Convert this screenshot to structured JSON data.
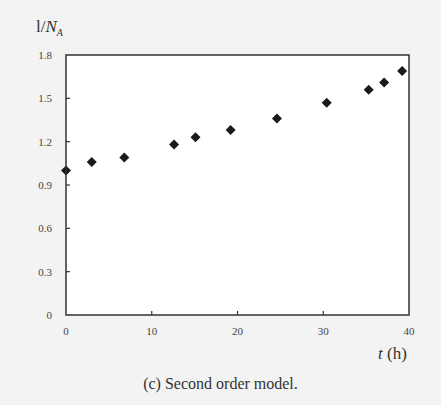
{
  "chart_data": {
    "type": "scatter",
    "title": "",
    "xlabel": "t (h)",
    "xlabel_var": "t",
    "xlabel_unit": " (h)",
    "ylabel": "1/N_A",
    "ylabel_prefix": "l/",
    "ylabel_var": "N",
    "ylabel_sub": "A",
    "xlim": [
      0,
      40
    ],
    "ylim": [
      0,
      1.8
    ],
    "xticks": [
      0,
      10,
      20,
      30,
      40
    ],
    "xtick_labels": [
      "0",
      "10",
      "20",
      "30",
      "40"
    ],
    "yticks": [
      0,
      0.3,
      0.6,
      0.9,
      1.2,
      1.5,
      1.8
    ],
    "ytick_labels": [
      "0",
      "0.3",
      "0.6",
      "0.9",
      "1.2",
      "1.5",
      "1.8"
    ],
    "grid": false,
    "marker": "diamond",
    "marker_color": "#1a1a1a",
    "series": [
      {
        "name": "Second order model",
        "x": [
          0,
          3.0,
          6.8,
          12.6,
          15.1,
          19.2,
          24.6,
          30.4,
          35.3,
          37.1,
          39.2
        ],
        "y": [
          1.0,
          1.06,
          1.09,
          1.18,
          1.23,
          1.28,
          1.36,
          1.47,
          1.56,
          1.61,
          1.69
        ]
      }
    ],
    "caption": "(c) Second order model."
  }
}
